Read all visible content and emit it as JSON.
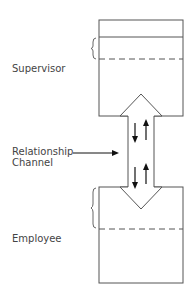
{
  "diagram": {
    "top_box": {
      "label": "Supervisor"
    },
    "bottom_box": {
      "label": "Employee"
    },
    "channel": {
      "label_line1": "Relationship",
      "label_line2": "Channel"
    },
    "colors": {
      "line": "#555555",
      "arrow": "#111111",
      "text": "#444444"
    }
  }
}
